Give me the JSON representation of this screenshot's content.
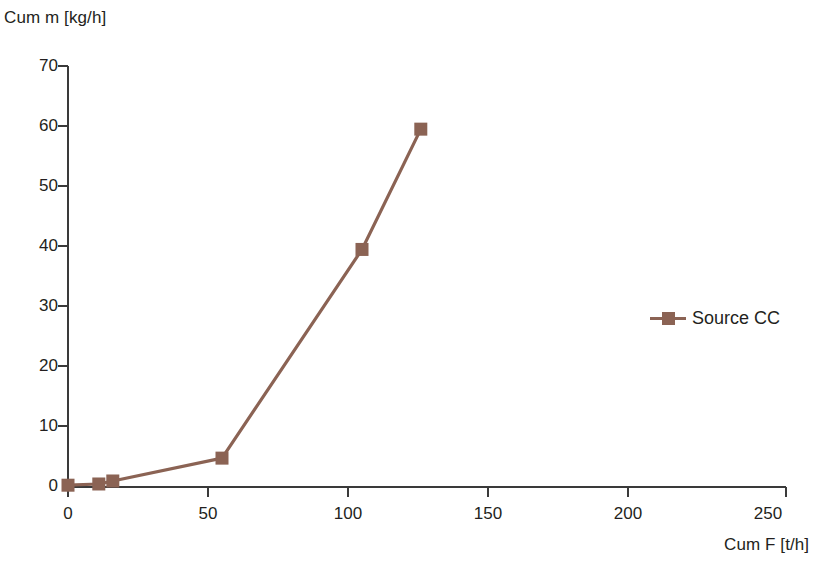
{
  "chart_data": {
    "type": "line",
    "title": "",
    "xlabel": "Cum F [t/h]",
    "ylabel": "Cum m [kg/h]",
    "xlim": [
      0,
      250
    ],
    "ylim": [
      0,
      70
    ],
    "xticks": [
      0,
      50,
      100,
      150,
      200,
      250
    ],
    "yticks": [
      0,
      10,
      20,
      30,
      40,
      50,
      60,
      70
    ],
    "xtick_labels": [
      "0",
      "50",
      "100",
      "150",
      "200",
      "250"
    ],
    "ytick_labels": [
      "0",
      "10",
      "20",
      "30",
      "40",
      "50",
      "60",
      "70"
    ],
    "grid": false,
    "legend_position": "right",
    "series": [
      {
        "name": "Source CC",
        "color": "#8b6354",
        "marker": "square",
        "x": [
          0,
          11,
          16,
          55,
          105,
          126
        ],
        "y": [
          0.3,
          0.5,
          1.0,
          4.8,
          39.5,
          59.5
        ]
      }
    ]
  },
  "legend": {
    "entries": [
      {
        "label": "Source CC",
        "color": "#8b6354"
      }
    ]
  },
  "axes": {
    "y_title": "Cum m [kg/h]",
    "x_title": "Cum F [t/h]",
    "axis_color": "#3a3a3a"
  }
}
